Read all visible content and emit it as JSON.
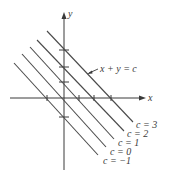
{
  "figure": {
    "type": "level-curves",
    "equation_label": "x + y = c",
    "axes": {
      "x_label": "x",
      "y_label": "y"
    },
    "lines": [
      {
        "c": 3,
        "label": "c = 3"
      },
      {
        "c": 2,
        "label": "c = 2"
      },
      {
        "c": 1,
        "label": "c = 1"
      },
      {
        "c": 0,
        "label": "c = 0"
      },
      {
        "c": -1,
        "label": "c = −1"
      }
    ],
    "x_ticks": [
      -1,
      0,
      1,
      2,
      3
    ],
    "y_ticks": [
      3,
      2,
      1,
      0,
      -1
    ],
    "colors": {
      "line": "#4a4a4a",
      "axis": "#3a3a3a",
      "text": "#3a3a3a"
    }
  }
}
